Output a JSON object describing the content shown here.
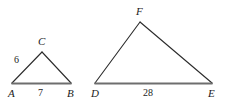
{
  "figure": {
    "width": 226,
    "height": 102,
    "background_color": "#ffffff",
    "stroke_color": "#2b2b2b",
    "base_stroke_color": "#6e6e6e",
    "text_color": "#1b1b1b"
  },
  "triangles": [
    {
      "name": "triangle-abc",
      "vertices": [
        {
          "label": "A",
          "x": 12,
          "y": 83,
          "label_x": 8,
          "label_y": 88
        },
        {
          "label": "B",
          "x": 71,
          "y": 83,
          "label_x": 67,
          "label_y": 88
        },
        {
          "label": "C",
          "x": 42,
          "y": 52,
          "label_x": 38,
          "label_y": 36
        }
      ],
      "sides": [
        {
          "name": "side-ac",
          "label": "6",
          "label_x": 14,
          "label_y": 55
        },
        {
          "name": "side-ab",
          "label": "7",
          "label_x": 38,
          "label_y": 88
        },
        {
          "name": "side-bc",
          "label": "",
          "label_x": 0,
          "label_y": 0
        }
      ]
    },
    {
      "name": "triangle-def",
      "vertices": [
        {
          "label": "D",
          "x": 95,
          "y": 83,
          "label_x": 91,
          "label_y": 88
        },
        {
          "label": "E",
          "x": 212,
          "y": 83,
          "label_x": 208,
          "label_y": 88
        },
        {
          "label": "F",
          "x": 140,
          "y": 22,
          "label_x": 136,
          "label_y": 6
        }
      ],
      "sides": [
        {
          "name": "side-df",
          "label": "",
          "label_x": 0,
          "label_y": 0
        },
        {
          "name": "side-de",
          "label": "28",
          "label_x": 143,
          "label_y": 88
        },
        {
          "name": "side-fe",
          "label": "",
          "label_x": 0,
          "label_y": 0
        }
      ]
    }
  ]
}
